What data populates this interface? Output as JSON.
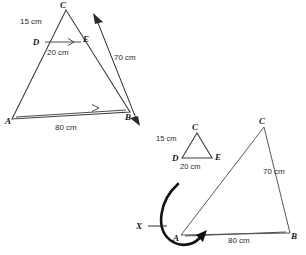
{
  "diagram": {
    "colors": {
      "stroke": "#555a5e",
      "stroke_dark": "#3a3d40",
      "arrow": "#111111",
      "text": "#2b2b2b",
      "background": "#ffffff"
    },
    "figure_left": {
      "name": "triangle-abc-with-midsegment",
      "vertices": {
        "A": "A",
        "B": "B",
        "C": "C",
        "D": "D",
        "E": "E"
      },
      "measurements": {
        "CD": "15 cm",
        "DE": "20 cm",
        "CB": "70 cm",
        "AB": "80 cm"
      }
    },
    "figure_right_small": {
      "name": "small-triangle-cde",
      "vertices": {
        "C": "C",
        "D": "D",
        "E": "E"
      },
      "measurements": {
        "CD": "15 cm",
        "DE": "20 cm"
      }
    },
    "figure_right_large": {
      "name": "large-triangle-abc",
      "vertices": {
        "A": "A",
        "B": "B",
        "C": "C"
      },
      "measurements": {
        "CB": "70 cm",
        "AB": "80 cm"
      }
    },
    "annotation": {
      "scale_label": "X"
    }
  }
}
